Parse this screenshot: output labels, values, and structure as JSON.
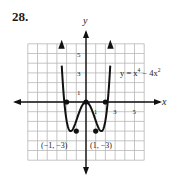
{
  "problem": {
    "number": "28."
  },
  "chart_data": {
    "type": "line",
    "title": "",
    "equation": "y = x⁴ − 4x²",
    "equation_parts": {
      "lhs": "y = x",
      "exp1": "4",
      "mid": " − 4x",
      "exp2": "2"
    },
    "xlabel": "x",
    "ylabel": "y",
    "xlim": [
      -6,
      6
    ],
    "ylim": [
      -6,
      6
    ],
    "grid": true,
    "x_ticks": [
      1,
      3,
      5
    ],
    "x_tick_labels": [
      "1",
      "3",
      "5"
    ],
    "y_ticks": [
      1,
      3,
      5
    ],
    "y_tick_labels": [
      "1",
      "3",
      "5"
    ],
    "series": [
      {
        "name": "y = x^4 - 4x^2",
        "x": [
          -2.5,
          -2,
          -1.5,
          -1,
          -0.5,
          0,
          0.5,
          1,
          1.5,
          2,
          2.5
        ],
        "y": [
          6,
          0,
          -2.3,
          -3,
          -0.9,
          0,
          -0.9,
          -3,
          -2.3,
          0,
          6
        ],
        "arrows_at_ends": true
      }
    ],
    "marked_points": [
      {
        "x": -2,
        "y": 0
      },
      {
        "x": 0,
        "y": 0
      },
      {
        "x": 2,
        "y": 0
      },
      {
        "x": -1,
        "y": -3
      },
      {
        "x": 1,
        "y": -3
      }
    ],
    "annotations": [
      {
        "text": "(−1, −3)",
        "x": -1,
        "y": -3
      },
      {
        "text": "(1, −3)",
        "x": 1,
        "y": -3
      }
    ]
  }
}
